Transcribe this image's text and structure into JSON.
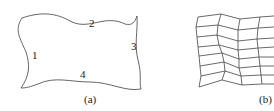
{
  "figure": {
    "panel_a": {
      "caption": "(a)",
      "edge_labels": [
        "1",
        "2",
        "3",
        "4"
      ]
    },
    "panel_b": {
      "caption": "(b)"
    }
  }
}
